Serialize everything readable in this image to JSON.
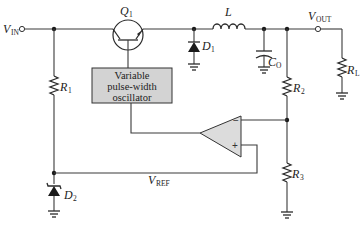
{
  "diagram": {
    "labels": {
      "vin": {
        "main": "V",
        "sub": "IN"
      },
      "vout": {
        "main": "V",
        "sub": "OUT"
      },
      "vref": {
        "main": "V",
        "sub": "REF"
      },
      "q1": {
        "main": "Q",
        "sub": "1"
      },
      "l": {
        "main": "L"
      },
      "d1": {
        "main": "D",
        "sub": "1"
      },
      "d2": {
        "main": "D",
        "sub": "2"
      },
      "co": {
        "main": "C",
        "sub": "O"
      },
      "r1": {
        "main": "R",
        "sub": "1"
      },
      "r2": {
        "main": "R",
        "sub": "2"
      },
      "r3": {
        "main": "R",
        "sub": "3"
      },
      "rl": {
        "main": "R",
        "sub": "L"
      }
    },
    "oscillator_box": {
      "lines": [
        "Variable",
        "pulse-width",
        "oscillator"
      ],
      "fill": "#d3d3d3"
    },
    "opamp": {
      "minus": "−",
      "plus": "+",
      "fill": "#dcdcdc"
    },
    "colors": {
      "wire": "#3a3a3a",
      "component": "#2a2a2a",
      "box_fill": "#d3d3d3",
      "opamp_fill": "#dcdcdc"
    }
  }
}
